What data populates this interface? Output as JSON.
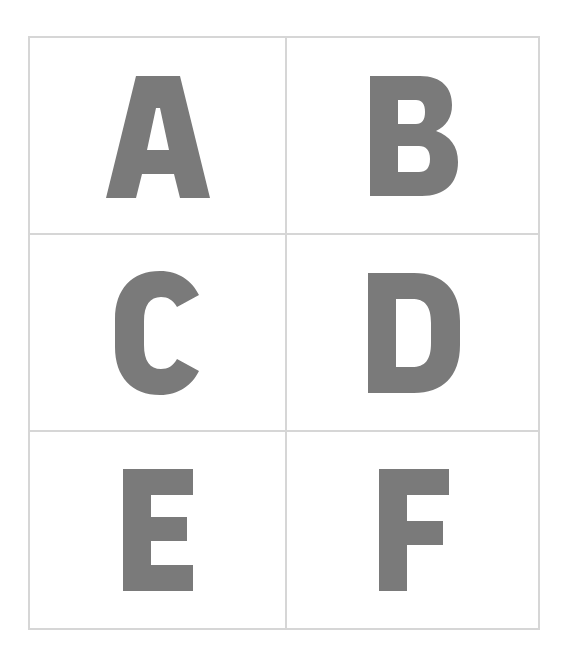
{
  "grid": {
    "rows": 3,
    "columns": 2,
    "line_color": "#d6d6d6",
    "letter_color": "#7a7a7a",
    "cells": [
      {
        "label": "A"
      },
      {
        "label": "B"
      },
      {
        "label": "C"
      },
      {
        "label": "D"
      },
      {
        "label": "E"
      },
      {
        "label": "F"
      }
    ]
  }
}
